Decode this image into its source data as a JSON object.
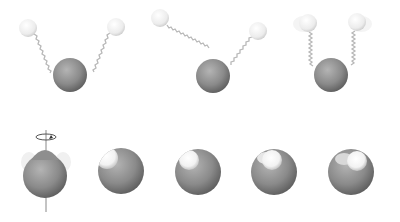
{
  "diagram": {
    "colors": {
      "background": "#ffffff",
      "oxygen_light": "#a8a8a8",
      "oxygen_dark": "#5e5e5e",
      "hydrogen_light": "#ffffff",
      "hydrogen_dark": "#d0d0d0",
      "spring": "#b8b8b8",
      "axis": "#777777"
    },
    "vibration_modes": [
      {
        "name": "symmetric-stretch",
        "oxygen": {
          "x": 70,
          "y": 75,
          "r": 17
        },
        "hydrogens": [
          {
            "x": 28,
            "y": 28,
            "r": 9
          },
          {
            "x": 116,
            "y": 27,
            "r": 9
          }
        ]
      },
      {
        "name": "asymmetric-stretch",
        "oxygen": {
          "x": 213,
          "y": 76,
          "r": 17
        },
        "hydrogens": [
          {
            "x": 160,
            "y": 18,
            "r": 9
          },
          {
            "x": 258,
            "y": 31,
            "r": 9
          }
        ]
      },
      {
        "name": "bending",
        "oxygen": {
          "x": 331,
          "y": 75,
          "r": 17
        },
        "hydrogens": [
          {
            "x": 308,
            "y": 23,
            "r": 9
          },
          {
            "x": 357,
            "y": 22,
            "r": 9
          }
        ]
      }
    ],
    "rotation_frames": [
      {
        "x": 45,
        "y": 172,
        "r": 23,
        "highlight": {
          "dx": 0,
          "dy": -20
        },
        "has_axis": true
      },
      {
        "x": 121,
        "y": 171,
        "r": 23,
        "highlight": {
          "dx": -13,
          "dy": -12
        },
        "has_axis": false
      },
      {
        "x": 198,
        "y": 172,
        "r": 23,
        "highlight": {
          "dx": -8,
          "dy": -11
        },
        "has_axis": false
      },
      {
        "x": 274,
        "y": 172,
        "r": 23,
        "highlight": {
          "dx": -2,
          "dy": -11
        },
        "has_axis": false
      },
      {
        "x": 351,
        "y": 172,
        "r": 23,
        "highlight": {
          "dx": 5,
          "dy": -11
        },
        "has_axis": false
      }
    ]
  }
}
